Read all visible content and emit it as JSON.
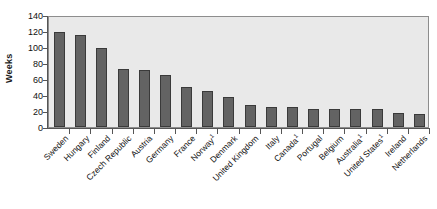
{
  "chart_data": {
    "type": "bar",
    "title": "",
    "subtitle": "",
    "xlabel": "",
    "ylabel": "Weeks",
    "ylim": [
      0,
      140
    ],
    "yticks": [
      140,
      120,
      100,
      80,
      60,
      40,
      20,
      0
    ],
    "grid": false,
    "legend": false,
    "bar_color": "#636363",
    "bar_edge_color": "#3a3a3a",
    "plot_background": "#e9e9e9",
    "categories": [
      "Sweden",
      "Hungary",
      "Finland",
      "Czech Republic",
      "Austria",
      "Germany",
      "France",
      "Norway",
      "Denmark",
      "United Kingdom",
      "Italy",
      "Canada",
      "Portugal",
      "Belgium",
      "Australia",
      "United States",
      "Ireland",
      "Netherlands"
    ],
    "category_footnotes": [
      "",
      "",
      "",
      "",
      "",
      "",
      "",
      "1",
      "",
      "",
      "",
      "1",
      "",
      "",
      "1",
      "1",
      "",
      ""
    ],
    "values": [
      119,
      115,
      99,
      73,
      71,
      65,
      50,
      45,
      38,
      27,
      25,
      25,
      23,
      23,
      22,
      22,
      17,
      16
    ]
  }
}
